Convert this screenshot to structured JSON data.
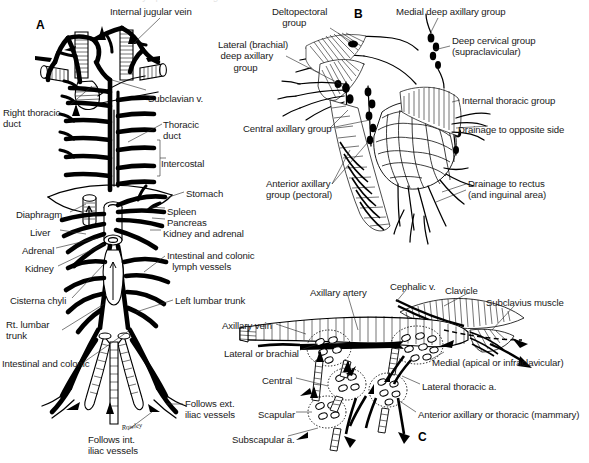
{
  "figure": {
    "background": "#ffffff",
    "ink_color": "#000000",
    "text_color": "#1a1a1a",
    "cropped_caption_remnant": "lymphatic drainage",
    "panels": [
      {
        "letter": "A",
        "name": "thoracic-duct-and-abdominal-lymphatics"
      },
      {
        "letter": "B",
        "name": "breast-and-axillary-lymph-node-groups"
      },
      {
        "letter": "C",
        "name": "axillary-lymph-node-groups-detail"
      }
    ],
    "artist_signature": "Rowley"
  },
  "panel_a": {
    "letter": "A",
    "labels": [
      {
        "name": "internal-jugular-vein",
        "text": "Internal jugular vein",
        "x": 110,
        "y": 6,
        "align": "left"
      },
      {
        "name": "subclavian-vein",
        "text": "Subclavian v.",
        "x": 148,
        "y": 93,
        "align": "left"
      },
      {
        "name": "right-thoracic-duct",
        "text": "Right thoracic\nduct",
        "x": 3,
        "y": 107,
        "align": "left"
      },
      {
        "name": "thoracic-duct",
        "text": "Thoracic\nduct",
        "x": 163,
        "y": 119,
        "align": "left"
      },
      {
        "name": "intercostal",
        "text": "Intercostal",
        "x": 161,
        "y": 158,
        "align": "left"
      },
      {
        "name": "stomach",
        "text": "Stomach",
        "x": 186,
        "y": 188,
        "align": "left"
      },
      {
        "name": "diaphragm",
        "text": "Diaphragm",
        "x": 16,
        "y": 209,
        "align": "left"
      },
      {
        "name": "spleen",
        "text": "Spleen",
        "x": 167,
        "y": 206,
        "align": "left"
      },
      {
        "name": "pancreas",
        "text": "Pancreas",
        "x": 167,
        "y": 217,
        "align": "left"
      },
      {
        "name": "kidney-and-adrenal",
        "text": "Kidney and adrenal",
        "x": 163,
        "y": 228,
        "align": "left"
      },
      {
        "name": "liver",
        "text": "Liver",
        "x": 30,
        "y": 227,
        "align": "left"
      },
      {
        "name": "adrenal",
        "text": "Adrenal",
        "x": 22,
        "y": 245,
        "align": "left"
      },
      {
        "name": "kidney",
        "text": "Kidney",
        "x": 25,
        "y": 263,
        "align": "left"
      },
      {
        "name": "intestinal-and-colonic-lymph-vessels",
        "text": "Intestinal and colonic\n  lymph vessels",
        "x": 167,
        "y": 250,
        "align": "left"
      },
      {
        "name": "cisterna-chyli",
        "text": "Cisterna chyli",
        "x": 10,
        "y": 295,
        "align": "left"
      },
      {
        "name": "left-lumbar-trunk",
        "text": "Left lumbar trunk",
        "x": 175,
        "y": 295,
        "align": "left"
      },
      {
        "name": "right-lumbar-trunk",
        "text": "Rt. lumbar\ntrunk",
        "x": 6,
        "y": 319,
        "align": "left"
      },
      {
        "name": "intestinal-and-colonic",
        "text": "Intestinal and colonic",
        "x": 2,
        "y": 358,
        "align": "left"
      },
      {
        "name": "follows-external-iliac-vessels",
        "text": "Follows ext.\niliac vessels",
        "x": 185,
        "y": 398,
        "align": "left"
      },
      {
        "name": "follows-internal-iliac-vessels",
        "text": "Follows int.\niliac vessels",
        "x": 88,
        "y": 434,
        "align": "left"
      }
    ]
  },
  "panel_b": {
    "letter": "B",
    "labels": [
      {
        "name": "deltopectoral-group",
        "text": "Deltopectoral\n    group",
        "x": 272,
        "y": 6,
        "align": "left"
      },
      {
        "name": "medial-deep-axillary-group",
        "text": "Medial deep axillary group",
        "x": 396,
        "y": 6,
        "align": "left"
      },
      {
        "name": "deep-cervical-group",
        "text": "Deep cervical group\n(supraclavicular)",
        "x": 452,
        "y": 35,
        "align": "left"
      },
      {
        "name": "lateral-brachial-deep-axillary-group",
        "text": "Lateral (brachial)\n deep axillary\n      group",
        "x": 218,
        "y": 39,
        "align": "left"
      },
      {
        "name": "internal-thoracic-group",
        "text": "Internal thoracic group",
        "x": 462,
        "y": 95,
        "align": "left"
      },
      {
        "name": "central-axillary-group",
        "text": "Central axillary group",
        "x": 243,
        "y": 123,
        "align": "left"
      },
      {
        "name": "drainage-to-opposite-side",
        "text": "Drainage to opposite side",
        "x": 458,
        "y": 124,
        "align": "left"
      },
      {
        "name": "anterior-axillary-group-pectoral",
        "text": "Anterior axillary\ngroup (pectoral)",
        "x": 266,
        "y": 178,
        "align": "left"
      },
      {
        "name": "drainage-to-rectus",
        "text": "Drainage to rectus\n(and inguinal area)",
        "x": 468,
        "y": 178,
        "align": "left"
      }
    ]
  },
  "panel_c": {
    "letter": "C",
    "labels": [
      {
        "name": "axillary-artery",
        "text": "Axillary artery",
        "x": 310,
        "y": 287,
        "align": "left"
      },
      {
        "name": "cephalic-vein",
        "text": "Cephalic v.",
        "x": 390,
        "y": 281,
        "align": "left"
      },
      {
        "name": "clavicle",
        "text": "Clavicle",
        "x": 445,
        "y": 285,
        "align": "left"
      },
      {
        "name": "subclavius-muscle",
        "text": "Subclavius muscle",
        "x": 486,
        "y": 297,
        "align": "left"
      },
      {
        "name": "axillary-vein",
        "text": "Axillary vein",
        "x": 222,
        "y": 320,
        "align": "left"
      },
      {
        "name": "lateral-or-brachial",
        "text": "Lateral or brachial",
        "x": 224,
        "y": 348,
        "align": "left"
      },
      {
        "name": "medial-apical-or-infraclavicular",
        "text": "Medial (apical or infraclavicular)",
        "x": 432,
        "y": 357,
        "align": "left"
      },
      {
        "name": "central",
        "text": "Central",
        "x": 262,
        "y": 375,
        "align": "left"
      },
      {
        "name": "lateral-thoracic-artery",
        "text": "Lateral thoracic a.",
        "x": 422,
        "y": 381,
        "align": "left"
      },
      {
        "name": "scapular",
        "text": "Scapular",
        "x": 258,
        "y": 409,
        "align": "left"
      },
      {
        "name": "anterior-axillary-or-thoracic-mammary",
        "text": "Anterior axillary or thoracic (mammary)",
        "x": 418,
        "y": 409,
        "align": "left"
      },
      {
        "name": "subscapular-artery",
        "text": "Subscapular a.",
        "x": 232,
        "y": 434,
        "align": "left"
      }
    ]
  }
}
